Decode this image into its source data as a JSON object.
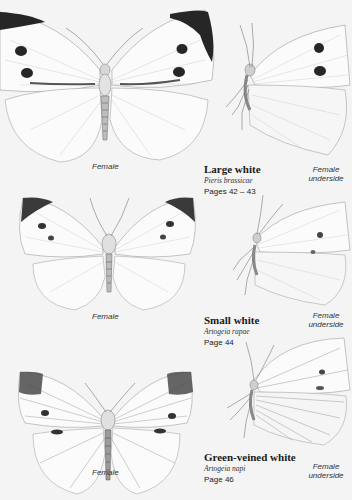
{
  "page": {
    "background": "#f4f4f4",
    "species": [
      {
        "common_name": "Large white",
        "latin_name": "Pieris brassicae",
        "page_ref": "Pages 42 – 43",
        "upperside_caption": "Female",
        "underside_caption_line1": "Female",
        "underside_caption_line2": "underside"
      },
      {
        "common_name": "Small white",
        "latin_name": "Artogeia rapae",
        "page_ref": "Page 44",
        "upperside_caption": "Female",
        "underside_caption_line1": "Female",
        "underside_caption_line2": "underside"
      },
      {
        "common_name": "Green-veined white",
        "latin_name": "Artogeia napi",
        "page_ref": "Page 46",
        "upperside_caption": "Female",
        "underside_caption_line1": "Female",
        "underside_caption_line2": "underside"
      }
    ],
    "colors": {
      "wing": "#fbfbfb",
      "wing_line": "#9a9a9a",
      "marking": "#262626",
      "vein": "#b5b5b5"
    }
  }
}
